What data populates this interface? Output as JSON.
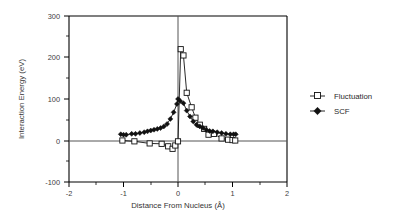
{
  "chart_data": {
    "type": "line",
    "title": "",
    "xlabel": "Distance From Nucleus (Å)",
    "ylabel": "Interaction Energy (eV)",
    "xlim": [
      -2,
      2
    ],
    "ylim": [
      -100,
      300
    ],
    "xticks": [
      -2,
      -1,
      0,
      1,
      2
    ],
    "xtick_labels": [
      "-2",
      "-1",
      "0",
      "1",
      "2"
    ],
    "xticks_minor": [
      -1.5,
      -0.5,
      0.5,
      1.5
    ],
    "yticks": [
      -100,
      0,
      100,
      200,
      300
    ],
    "ytick_labels": [
      "-100",
      "0",
      "100",
      "200",
      "300"
    ],
    "yticks_minor": [
      -50,
      50,
      150,
      250
    ],
    "grid": false,
    "legend_position": "right",
    "zero_lines": {
      "x": 0,
      "y": 0
    },
    "series": [
      {
        "name": "Fluctuation",
        "marker": "open-square",
        "color": "#111111",
        "x": [
          -1.02,
          -0.8,
          -0.52,
          -0.3,
          -0.18,
          -0.1,
          -0.05,
          0.0,
          0.05,
          0.1,
          0.16,
          0.25,
          0.32,
          0.4,
          0.48,
          0.56,
          0.66,
          0.8,
          0.92,
          1.0,
          1.05
        ],
        "y": [
          0,
          -2,
          -7,
          -8,
          -14,
          -20,
          -12,
          -2,
          220,
          205,
          115,
          80,
          55,
          38,
          28,
          14,
          16,
          5,
          2,
          1,
          0
        ]
      },
      {
        "name": "SCF",
        "marker": "filled-diamond",
        "color": "#111111",
        "x": [
          -1.05,
          -1.0,
          -0.95,
          -0.85,
          -0.78,
          -0.7,
          -0.62,
          -0.56,
          -0.5,
          -0.44,
          -0.38,
          -0.32,
          -0.26,
          -0.2,
          -0.14,
          -0.08,
          -0.02,
          0.0,
          0.04,
          0.1,
          0.16,
          0.22,
          0.28,
          0.34,
          0.4,
          0.46,
          0.52,
          0.58,
          0.64,
          0.72,
          0.8,
          0.88,
          0.96,
          1.02,
          1.06
        ],
        "y": [
          15,
          14,
          14,
          16,
          16,
          18,
          20,
          22,
          24,
          26,
          28,
          30,
          34,
          40,
          52,
          68,
          88,
          100,
          95,
          90,
          72,
          58,
          46,
          38,
          34,
          30,
          26,
          23,
          22,
          20,
          18,
          16,
          15,
          15,
          15
        ]
      }
    ],
    "legend_entries": [
      {
        "label": "Fluctuation",
        "marker": "open-square"
      },
      {
        "label": "SCF",
        "marker": "filled-diamond"
      }
    ]
  }
}
